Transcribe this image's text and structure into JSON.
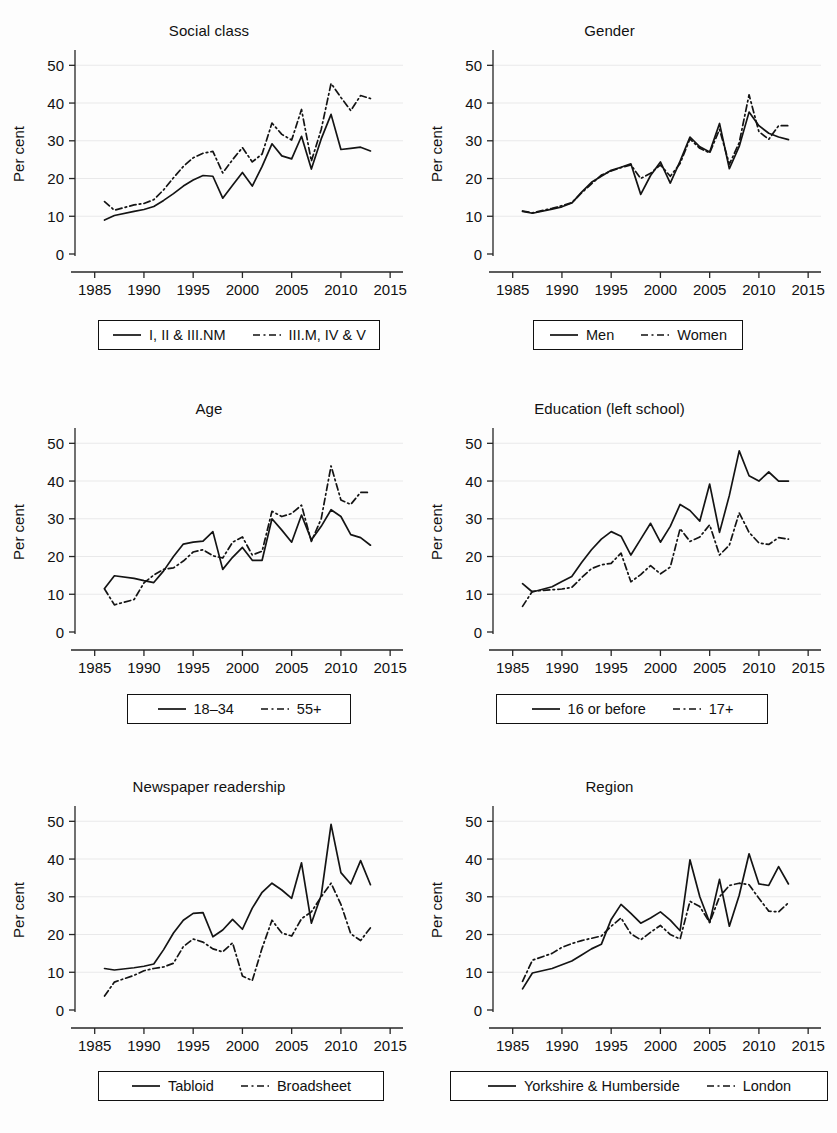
{
  "figure": {
    "panel_count": 6,
    "y_axis_label": "Per cent",
    "y_ticks": [
      "0",
      "10",
      "20",
      "30",
      "40",
      "50"
    ],
    "x_ticks": [
      "1985",
      "1990",
      "1995",
      "2000",
      "2005",
      "2010",
      "2015"
    ]
  },
  "panels": [
    {
      "title": "Social class",
      "legend": {
        "solid": "I, II & III.NM",
        "dashed": "III.M, IV & V"
      }
    },
    {
      "title": "Gender",
      "legend": {
        "solid": "Men",
        "dashed": "Women"
      }
    },
    {
      "title": "Age",
      "legend": {
        "solid": "18–34",
        "dashed": "55+"
      }
    },
    {
      "title": "Education (left school)",
      "legend": {
        "solid": "16 or before",
        "dashed": "17+"
      }
    },
    {
      "title": "Newspaper readership",
      "legend": {
        "solid": "Tabloid",
        "dashed": "Broadsheet"
      }
    },
    {
      "title": "Region",
      "legend": {
        "solid": "Yorkshire & Humberside",
        "dashed": "London"
      }
    }
  ],
  "chart_data": [
    {
      "type": "line",
      "title": "Social class",
      "xlabel": "",
      "ylabel": "Per cent",
      "xlim": [
        1983,
        2016
      ],
      "ylim": [
        0,
        53
      ],
      "x_ticks": [
        1985,
        1990,
        1995,
        2000,
        2005,
        2010,
        2015
      ],
      "y_ticks": [
        0,
        10,
        20,
        30,
        40,
        50
      ],
      "grid": "horizontal",
      "legend_position": "below",
      "x": [
        1986,
        1987,
        1989,
        1990,
        1991,
        1992,
        1993,
        1994,
        1995,
        1996,
        1997,
        1998,
        1999,
        2000,
        2001,
        2002,
        2003,
        2004,
        2005,
        2006,
        2007,
        2008,
        2009,
        2010,
        2011,
        2012,
        2013
      ],
      "series": [
        {
          "name": "I, II & III.NM",
          "style": "solid",
          "values": [
            9.0,
            10.2,
            11.3,
            11.8,
            12.6,
            14.2,
            16.0,
            18.0,
            19.6,
            20.8,
            20.6,
            14.8,
            18.2,
            21.6,
            18.0,
            23.2,
            29.2,
            26.0,
            25.2,
            31.2,
            22.5,
            30.5,
            37.0,
            27.7,
            28.0,
            28.3,
            27.3
          ]
        },
        {
          "name": "III.M, IV & V",
          "style": "dashed",
          "values": [
            13.9,
            11.6,
            13.0,
            13.4,
            14.4,
            17.0,
            20.2,
            23.2,
            25.5,
            26.7,
            27.2,
            21.5,
            25.0,
            28.2,
            24.4,
            26.5,
            34.7,
            31.7,
            30.2,
            38.3,
            24.6,
            33.0,
            45.2,
            41.5,
            38.0,
            42.0,
            41.2
          ]
        }
      ]
    },
    {
      "type": "line",
      "title": "Gender",
      "xlabel": "",
      "ylabel": "Per cent",
      "xlim": [
        1983,
        2016
      ],
      "ylim": [
        0,
        53
      ],
      "x_ticks": [
        1985,
        1990,
        1995,
        2000,
        2005,
        2010,
        2015
      ],
      "y_ticks": [
        0,
        10,
        20,
        30,
        40,
        50
      ],
      "grid": "horizontal",
      "legend_position": "below",
      "x": [
        1986,
        1987,
        1989,
        1990,
        1991,
        1992,
        1993,
        1994,
        1995,
        1996,
        1997,
        1998,
        1999,
        2000,
        2001,
        2002,
        2003,
        2004,
        2005,
        2006,
        2007,
        2008,
        2009,
        2010,
        2011,
        2012,
        2013
      ],
      "series": [
        {
          "name": "Men",
          "style": "solid",
          "values": [
            11.3,
            10.8,
            11.9,
            12.5,
            13.5,
            16.4,
            19.0,
            20.6,
            22.2,
            23.0,
            23.9,
            15.8,
            20.8,
            24.4,
            18.8,
            24.6,
            31.0,
            28.4,
            27.0,
            34.6,
            22.6,
            28.5,
            37.6,
            34.0,
            32.0,
            31.0,
            30.3
          ]
        },
        {
          "name": "Women",
          "style": "dashed",
          "values": [
            11.4,
            10.9,
            12.1,
            12.8,
            13.6,
            16.2,
            18.6,
            20.9,
            22.0,
            22.9,
            23.6,
            20.0,
            21.4,
            23.6,
            20.6,
            24.0,
            30.5,
            28.0,
            26.8,
            33.0,
            23.8,
            29.5,
            42.2,
            32.4,
            30.4,
            34.0,
            34.0
          ]
        }
      ]
    },
    {
      "type": "line",
      "title": "Age",
      "xlabel": "",
      "ylabel": "Per cent",
      "xlim": [
        1983,
        2016
      ],
      "ylim": [
        0,
        53
      ],
      "x_ticks": [
        1985,
        1990,
        1995,
        2000,
        2005,
        2010,
        2015
      ],
      "y_ticks": [
        0,
        10,
        20,
        30,
        40,
        50
      ],
      "grid": "horizontal",
      "legend_position": "below",
      "x": [
        1986,
        1987,
        1989,
        1990,
        1991,
        1992,
        1993,
        1994,
        1995,
        1996,
        1997,
        1998,
        1999,
        2000,
        2001,
        2002,
        2003,
        2004,
        2005,
        2006,
        2007,
        2008,
        2009,
        2010,
        2011,
        2012,
        2013
      ],
      "series": [
        {
          "name": "18–34",
          "style": "solid",
          "values": [
            11.5,
            14.9,
            14.2,
            13.6,
            13.1,
            16.2,
            20.0,
            23.3,
            23.8,
            24.1,
            26.6,
            16.6,
            19.8,
            22.4,
            19.0,
            19.0,
            30.0,
            27.0,
            23.8,
            31.0,
            24.4,
            28.0,
            32.4,
            30.6,
            25.8,
            25.0,
            23.0
          ]
        },
        {
          "name": "55+",
          "style": "dashed",
          "values": [
            11.4,
            7.2,
            8.6,
            13.0,
            15.1,
            16.6,
            17.0,
            18.8,
            21.2,
            21.8,
            20.2,
            19.6,
            23.8,
            25.2,
            20.4,
            21.4,
            32.0,
            30.6,
            31.4,
            33.6,
            24.0,
            30.0,
            44.0,
            35.0,
            33.8,
            37.0,
            37.0
          ]
        }
      ]
    },
    {
      "type": "line",
      "title": "Education (left school)",
      "xlabel": "",
      "ylabel": "Per cent",
      "xlim": [
        1983,
        2016
      ],
      "ylim": [
        0,
        53
      ],
      "x_ticks": [
        1985,
        1990,
        1995,
        2000,
        2005,
        2010,
        2015
      ],
      "y_ticks": [
        0,
        10,
        20,
        30,
        40,
        50
      ],
      "grid": "horizontal",
      "legend_position": "below",
      "x": [
        1986,
        1987,
        1989,
        1990,
        1991,
        1992,
        1993,
        1994,
        1995,
        1996,
        1997,
        1998,
        1999,
        2000,
        2001,
        2002,
        2003,
        2004,
        2005,
        2006,
        2007,
        2008,
        2009,
        2010,
        2011,
        2012,
        2013
      ],
      "series": [
        {
          "name": "16 or before",
          "style": "solid",
          "values": [
            12.8,
            10.6,
            12.0,
            13.4,
            14.7,
            18.4,
            21.8,
            24.6,
            26.6,
            25.4,
            20.4,
            24.6,
            28.8,
            23.8,
            28.0,
            33.8,
            32.2,
            29.4,
            39.2,
            26.4,
            36.2,
            48.0,
            41.4,
            40.0,
            42.4,
            40.0,
            40.0
          ]
        },
        {
          "name": "17+",
          "style": "dashed",
          "values": [
            6.8,
            10.8,
            11.2,
            11.4,
            11.8,
            14.4,
            16.8,
            17.8,
            18.2,
            20.9,
            13.3,
            15.2,
            17.6,
            15.4,
            17.2,
            27.4,
            24.0,
            25.2,
            28.4,
            20.4,
            23.0,
            31.6,
            26.4,
            23.6,
            23.2,
            25.0,
            24.6
          ]
        }
      ]
    },
    {
      "type": "line",
      "title": "Newspaper readership",
      "xlabel": "",
      "ylabel": "Per cent",
      "xlim": [
        1983,
        2016
      ],
      "ylim": [
        0,
        53
      ],
      "x_ticks": [
        1985,
        1990,
        1995,
        2000,
        2005,
        2010,
        2015
      ],
      "y_ticks": [
        0,
        10,
        20,
        30,
        40,
        50
      ],
      "grid": "horizontal",
      "legend_position": "below",
      "x": [
        1986,
        1987,
        1989,
        1990,
        1991,
        1992,
        1993,
        1994,
        1995,
        1996,
        1997,
        1998,
        1999,
        2000,
        2001,
        2002,
        2003,
        2004,
        2005,
        2006,
        2007,
        2008,
        2009,
        2010,
        2011,
        2012,
        2013
      ],
      "series": [
        {
          "name": "Tabloid",
          "style": "solid",
          "values": [
            11.0,
            10.6,
            11.2,
            11.6,
            12.2,
            16.0,
            20.4,
            23.8,
            25.6,
            25.8,
            19.4,
            21.2,
            24.0,
            21.4,
            27.0,
            31.2,
            33.6,
            31.8,
            29.6,
            39.0,
            23.0,
            30.4,
            49.2,
            36.4,
            33.4,
            39.6,
            33.2
          ]
        },
        {
          "name": "Broadsheet",
          "style": "dashed",
          "values": [
            3.7,
            7.4,
            9.2,
            10.4,
            11.0,
            11.4,
            12.4,
            16.8,
            18.8,
            18.0,
            16.2,
            15.4,
            17.8,
            9.0,
            7.8,
            16.4,
            23.8,
            20.4,
            19.6,
            24.2,
            26.0,
            30.0,
            33.6,
            28.0,
            20.2,
            18.4,
            21.8
          ]
        }
      ]
    },
    {
      "type": "line",
      "title": "Region",
      "xlabel": "",
      "ylabel": "Per cent",
      "xlim": [
        1983,
        2016
      ],
      "ylim": [
        0,
        53
      ],
      "x_ticks": [
        1985,
        1990,
        1995,
        2000,
        2005,
        2010,
        2015
      ],
      "y_ticks": [
        0,
        10,
        20,
        30,
        40,
        50
      ],
      "grid": "horizontal",
      "legend_position": "below",
      "x": [
        1986,
        1987,
        1989,
        1990,
        1991,
        1992,
        1993,
        1994,
        1995,
        1996,
        1997,
        1998,
        1999,
        2000,
        2001,
        2002,
        2003,
        2004,
        2005,
        2006,
        2007,
        2008,
        2009,
        2010,
        2011,
        2012,
        2013
      ],
      "series": [
        {
          "name": "Yorkshire & Humberside",
          "style": "solid",
          "values": [
            5.6,
            9.8,
            11.0,
            12.0,
            13.0,
            14.6,
            16.2,
            17.4,
            24.0,
            28.0,
            25.6,
            23.0,
            24.4,
            26.0,
            23.8,
            21.0,
            39.8,
            30.0,
            23.2,
            34.6,
            22.2,
            30.4,
            41.4,
            33.4,
            33.0,
            38.0,
            33.4
          ]
        },
        {
          "name": "London",
          "style": "dashed",
          "values": [
            7.6,
            13.2,
            15.0,
            16.6,
            17.6,
            18.4,
            19.0,
            19.6,
            22.2,
            24.4,
            20.2,
            18.6,
            20.6,
            22.4,
            20.0,
            18.8,
            28.8,
            27.4,
            23.2,
            30.0,
            33.0,
            33.6,
            33.2,
            29.6,
            26.2,
            26.0,
            28.4
          ]
        }
      ]
    }
  ]
}
